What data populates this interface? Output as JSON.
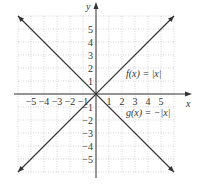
{
  "chart_data": {
    "type": "line",
    "title": "",
    "xlabel": "x",
    "ylabel": "y",
    "xlim": [
      -6,
      6
    ],
    "ylim": [
      -6,
      6
    ],
    "grid": true,
    "x_ticks": [
      -5,
      -4,
      -3,
      -2,
      -1,
      1,
      2,
      3,
      4,
      5
    ],
    "y_ticks": [
      5,
      4,
      3,
      2,
      1,
      -1,
      -2,
      -3,
      -4,
      -5
    ],
    "x_tick_labels": [
      "−5",
      "−4",
      "−3",
      "−2",
      "−1",
      "1",
      "2",
      "3",
      "4",
      "5"
    ],
    "y_tick_labels": [
      "5",
      "4",
      "3",
      "2",
      "1",
      "−1",
      "−2",
      "−3",
      "−4",
      "−5"
    ],
    "series": [
      {
        "name": "f(x) = |x|",
        "x": [
          -6,
          0,
          6
        ],
        "y": [
          6,
          0,
          6
        ]
      },
      {
        "name": "g(x) = −|x|",
        "x": [
          -6,
          0,
          6
        ],
        "y": [
          -6,
          0,
          -6
        ]
      }
    ],
    "annotations": [
      {
        "text": "f(x) = |x|",
        "x": 2.3,
        "y": 1.5
      },
      {
        "text": "g(x) = −|x|",
        "x": 2.3,
        "y": -1.2
      }
    ]
  },
  "labels": {
    "x_axis": "x",
    "y_axis": "y",
    "f_label": "f(x) = |x|",
    "g_label": "g(x) = −|x|"
  }
}
